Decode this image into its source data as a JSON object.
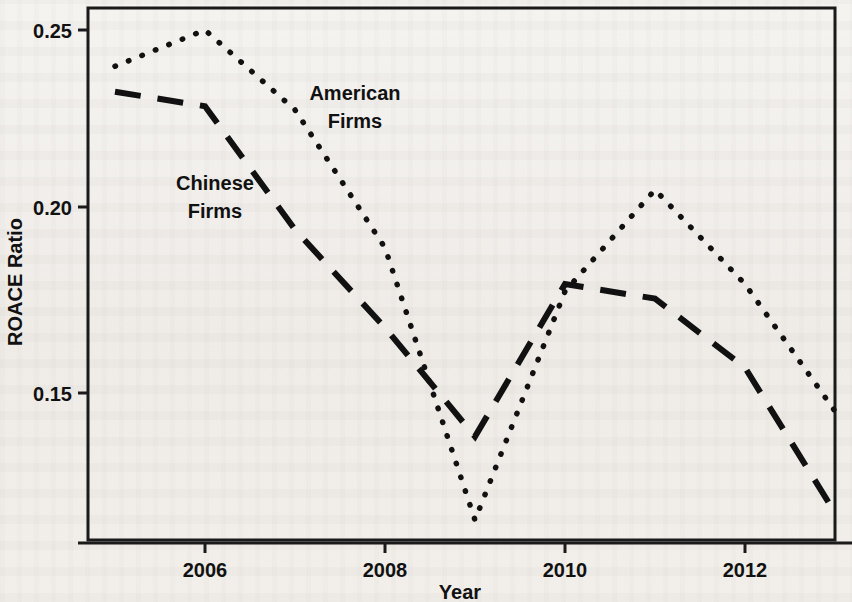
{
  "figure": {
    "background_color": "#f3f1ee",
    "ink_color": "#111111"
  },
  "chart_data": {
    "type": "line",
    "title": "",
    "xlabel": "Year",
    "ylabel": "ROACE Ratio",
    "x": [
      2005,
      2006,
      2007,
      2008,
      2009,
      2010,
      2011,
      2012,
      2013
    ],
    "xlim": [
      2004.7,
      2013.0
    ],
    "ylim": [
      0.108,
      0.2545
    ],
    "xticks": [
      2006,
      2008,
      2010,
      2012
    ],
    "xtick_labels": [
      "2006",
      "2008",
      "2010",
      "2012"
    ],
    "yticks": [
      0.15,
      0.2,
      0.25
    ],
    "ytick_labels": [
      "0.15",
      "0.20",
      "0.25"
    ],
    "grid": false,
    "legend_position": "inline-annotations",
    "series": [
      {
        "name": "American Firms",
        "style": "dotted",
        "color": "#111111",
        "values": [
          0.24,
          0.25,
          0.228,
          0.19,
          0.115,
          0.178,
          0.206,
          0.18,
          0.145
        ],
        "label_text_lines": [
          "American",
          "Firms"
        ]
      },
      {
        "name": "Chinese Firms",
        "style": "dashed",
        "color": "#111111",
        "values": [
          0.233,
          0.229,
          0.195,
          0.168,
          0.138,
          0.18,
          0.176,
          0.157,
          0.117
        ],
        "label_text_lines": [
          "Chinese",
          "Firms"
        ]
      }
    ],
    "annotations": [
      {
        "id": "american-label-line1",
        "text": "American",
        "x": 355,
        "y": 100
      },
      {
        "id": "american-label-line2",
        "text": "Firms",
        "x": 355,
        "y": 128
      },
      {
        "id": "chinese-label-line1",
        "text": "Chinese",
        "x": 215,
        "y": 190
      },
      {
        "id": "chinese-label-line2",
        "text": "Firms",
        "x": 215,
        "y": 218
      }
    ]
  },
  "labels": {
    "y_axis_title": "ROACE Ratio",
    "x_axis_title": "Year",
    "ytick_0": "0.15",
    "ytick_1": "0.20",
    "ytick_2": "0.25",
    "xtick_0": "2006",
    "xtick_1": "2008",
    "xtick_2": "2010",
    "xtick_3": "2012",
    "american_line1": "American",
    "american_line2": "Firms",
    "chinese_line1": "Chinese",
    "chinese_line2": "Firms"
  }
}
